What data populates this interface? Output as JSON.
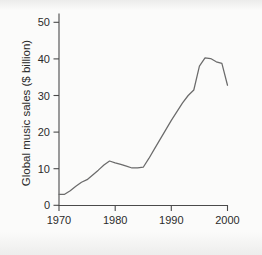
{
  "chart_data": {
    "type": "line",
    "title": "",
    "subtitle": "",
    "xlabel": "",
    "ylabel": "Global music sales ($ billion)",
    "xlim": [
      1970,
      2000
    ],
    "ylim": [
      0,
      52
    ],
    "grid": false,
    "legend": null,
    "legend_position": "none",
    "x_ticks": [
      1970,
      1980,
      1990,
      2000
    ],
    "x_tick_labels": [
      "1970",
      "1980",
      "1990",
      "2000"
    ],
    "y_ticks": [
      0,
      10,
      20,
      30,
      40,
      50
    ],
    "y_tick_labels": [
      "0",
      "10",
      "20",
      "30",
      "40",
      "50"
    ],
    "line_color": "#6b6b6b",
    "axis_color": "#4a4a4a",
    "background_color": "#fbfbfa",
    "x": [
      1970,
      1971,
      1972,
      1973,
      1974,
      1975,
      1976,
      1977,
      1978,
      1979,
      1980,
      1981,
      1982,
      1983,
      1984,
      1985,
      1986,
      1987,
      1988,
      1989,
      1990,
      1991,
      1992,
      1993,
      1994,
      1995,
      1996,
      1997,
      1998,
      1999,
      2000
    ],
    "values": [
      3.0,
      3.0,
      4.0,
      5.2,
      6.3,
      7.0,
      8.3,
      9.6,
      11.0,
      12.1,
      11.6,
      11.2,
      10.7,
      10.2,
      10.2,
      10.4,
      12.8,
      15.4,
      18.0,
      20.6,
      23.2,
      25.6,
      28.0,
      30.0,
      31.5,
      38.0,
      40.3,
      40.1,
      39.2,
      38.8,
      32.8
    ],
    "annotations": []
  },
  "axis_titles": {
    "y": "Global music sales ($ billion)"
  }
}
